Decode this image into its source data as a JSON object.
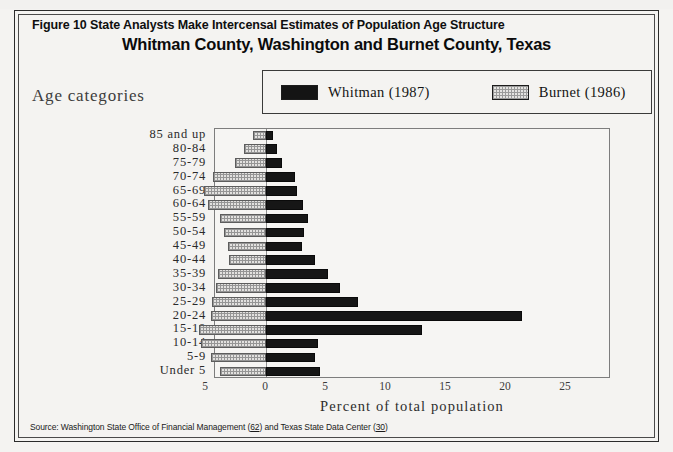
{
  "figure": {
    "title": "Figure 10   State Analysts Make Intercensal Estimates of Population Age Structure",
    "subtitle": "Whitman County, Washington and Burnet County, Texas",
    "y_axis_heading": "Age categories",
    "x_axis_title": "Percent of total population",
    "source_prefix": "Source: Washington State Office of Financial Management (",
    "source_ref1": "62",
    "source_middle": ") and Texas State Data Center (",
    "source_ref2": "30",
    "source_suffix": ")"
  },
  "legend": {
    "entries": [
      {
        "label": "Whitman (1987)",
        "swatch": "black-swatch-icon",
        "color": "#141414"
      },
      {
        "label": "Burnet (1986)",
        "swatch": "hatched-swatch-icon",
        "color": "#e4e3e1"
      }
    ]
  },
  "chart_data": {
    "type": "bar",
    "subtype": "population-pyramid",
    "title": "Whitman County, Washington and Burnet County, Texas",
    "xlabel": "Percent of total population",
    "ylabel": "Age categories",
    "grid": false,
    "legend_position": "top-right",
    "orientation": "horizontal",
    "xlim": [
      -5,
      27
    ],
    "xticks": [
      -5,
      0,
      5,
      10,
      15,
      20,
      25
    ],
    "xtick_labels": [
      "5",
      "0",
      "5",
      "10",
      "15",
      "20",
      "25"
    ],
    "axis_note": "Left side of zero shows Burnet (1986) percentages (plotted leftward); right side shows Whitman (1987) percentages.",
    "categories": [
      "85 and up",
      "80-84",
      "75-79",
      "70-74",
      "65-69",
      "60-64",
      "55-59",
      "50-54",
      "45-49",
      "40-44",
      "35-39",
      "30-34",
      "25-29",
      "20-24",
      "15-19",
      "10-14",
      "5-9",
      "Under 5"
    ],
    "series": [
      {
        "name": "Whitman (1987)",
        "color": "#141414",
        "values": [
          0.6,
          0.9,
          1.3,
          2.4,
          2.6,
          3.1,
          3.5,
          3.2,
          3.0,
          4.1,
          5.2,
          6.2,
          7.7,
          21.3,
          13.0,
          4.3,
          4.1,
          4.5
        ]
      },
      {
        "name": "Burnet (1986)",
        "color": "#e4e3e1",
        "values": [
          1.1,
          1.8,
          2.6,
          4.4,
          5.2,
          4.8,
          3.8,
          3.5,
          3.2,
          3.1,
          4.0,
          4.2,
          4.5,
          4.6,
          5.6,
          5.4,
          4.6,
          3.8
        ]
      }
    ],
    "rows": [
      {
        "category": "85 and up",
        "whitman": 0.6,
        "burnet": 1.1
      },
      {
        "category": "80-84",
        "whitman": 0.9,
        "burnet": 1.8
      },
      {
        "category": "75-79",
        "whitman": 1.3,
        "burnet": 2.6
      },
      {
        "category": "70-74",
        "whitman": 2.4,
        "burnet": 4.4
      },
      {
        "category": "65-69",
        "whitman": 2.6,
        "burnet": 5.2
      },
      {
        "category": "60-64",
        "whitman": 3.1,
        "burnet": 4.8
      },
      {
        "category": "55-59",
        "whitman": 3.5,
        "burnet": 3.8
      },
      {
        "category": "50-54",
        "whitman": 3.2,
        "burnet": 3.5
      },
      {
        "category": "45-49",
        "whitman": 3.0,
        "burnet": 3.2
      },
      {
        "category": "40-44",
        "whitman": 4.1,
        "burnet": 3.1
      },
      {
        "category": "35-39",
        "whitman": 5.2,
        "burnet": 4.0
      },
      {
        "category": "30-34",
        "whitman": 6.2,
        "burnet": 4.2
      },
      {
        "category": "25-29",
        "whitman": 7.7,
        "burnet": 4.5
      },
      {
        "category": "20-24",
        "whitman": 21.3,
        "burnet": 4.6
      },
      {
        "category": "15-19",
        "whitman": 13.0,
        "burnet": 5.6
      },
      {
        "category": "10-14",
        "whitman": 4.3,
        "burnet": 5.4
      },
      {
        "category": "5-9",
        "whitman": 4.1,
        "burnet": 4.6
      },
      {
        "category": "Under 5",
        "whitman": 4.5,
        "burnet": 3.8
      }
    ]
  },
  "geometry": {
    "zero_px": 51,
    "px_per_unit": 12,
    "row_height": 13.888
  }
}
